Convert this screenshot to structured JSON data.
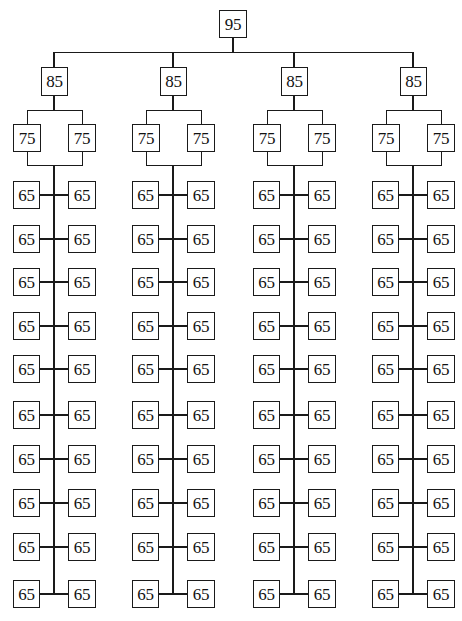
{
  "diagram": {
    "type": "hierarchy-tree",
    "root": {
      "label": "95"
    },
    "branches": [
      {
        "label": "85",
        "children_level2": [
          "75",
          "75"
        ],
        "leaf_rows": [
          [
            "65",
            "65"
          ],
          [
            "65",
            "65"
          ],
          [
            "65",
            "65"
          ],
          [
            "65",
            "65"
          ],
          [
            "65",
            "65"
          ],
          [
            "65",
            "65"
          ],
          [
            "65",
            "65"
          ],
          [
            "65",
            "65"
          ],
          [
            "65",
            "65"
          ],
          [
            "65",
            "65"
          ]
        ]
      },
      {
        "label": "85",
        "children_level2": [
          "75",
          "75"
        ],
        "leaf_rows": [
          [
            "65",
            "65"
          ],
          [
            "65",
            "65"
          ],
          [
            "65",
            "65"
          ],
          [
            "65",
            "65"
          ],
          [
            "65",
            "65"
          ],
          [
            "65",
            "65"
          ],
          [
            "65",
            "65"
          ],
          [
            "65",
            "65"
          ],
          [
            "65",
            "65"
          ],
          [
            "65",
            "65"
          ]
        ]
      },
      {
        "label": "85",
        "children_level2": [
          "75",
          "75"
        ],
        "leaf_rows": [
          [
            "65",
            "65"
          ],
          [
            "65",
            "65"
          ],
          [
            "65",
            "65"
          ],
          [
            "65",
            "65"
          ],
          [
            "65",
            "65"
          ],
          [
            "65",
            "65"
          ],
          [
            "65",
            "65"
          ],
          [
            "65",
            "65"
          ],
          [
            "65",
            "65"
          ],
          [
            "65",
            "65"
          ]
        ]
      },
      {
        "label": "85",
        "children_level2": [
          "75",
          "75"
        ],
        "leaf_rows": [
          [
            "65",
            "65"
          ],
          [
            "65",
            "65"
          ],
          [
            "65",
            "65"
          ],
          [
            "65",
            "65"
          ],
          [
            "65",
            "65"
          ],
          [
            "65",
            "65"
          ],
          [
            "65",
            "65"
          ],
          [
            "65",
            "65"
          ],
          [
            "65",
            "65"
          ],
          [
            "65",
            "65"
          ]
        ]
      }
    ],
    "colors": {
      "line": "#1a1a1a",
      "box_border": "#1a1a1a",
      "box_fill": "#ffffff",
      "text": "#111111",
      "background": "#ffffff"
    }
  }
}
